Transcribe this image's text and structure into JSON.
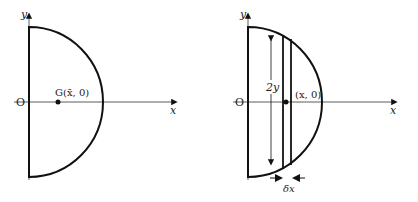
{
  "left": {
    "y_label": "y",
    "x_label": "x",
    "origin_label": "O",
    "centroid_label": "G(x̄, 0)"
  },
  "right": {
    "y_label": "y",
    "x_label": "x",
    "origin_label": "O",
    "height_label": "2y",
    "point_label": "(x, 0)",
    "width_label": "δx"
  },
  "colors": {
    "stroke": "#111111",
    "axis": "#333333"
  }
}
